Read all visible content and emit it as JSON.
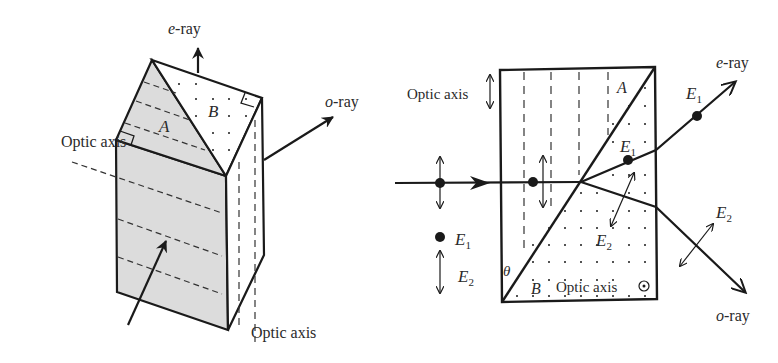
{
  "figure": {
    "left_panel": {
      "name": "Wollaston-style prism (3D view)",
      "labels": {
        "e_ray": "e-ray",
        "e_ray_italic": "e",
        "e_ray_rest": "-ray",
        "o_ray_italic": "o",
        "o_ray_rest": "-ray",
        "optic_axis_left": "Optic axis",
        "optic_axis_bottom": "Optic axis",
        "prism_a": "A",
        "prism_b": "B"
      }
    },
    "right_panel": {
      "name": "Prism cross-section with ray paths",
      "labels": {
        "optic_axis_top": "Optic axis",
        "optic_axis_bottom": "Optic axis",
        "prism_a": "A",
        "prism_b": "B",
        "theta": "θ",
        "e_ray_italic": "e",
        "e_ray_rest": "-ray",
        "o_ray_italic": "o",
        "o_ray_rest": "-ray",
        "E": "E",
        "sub1": "1",
        "sub2": "2"
      },
      "legend": [
        {
          "symbol": "dot",
          "label": "E",
          "sub": "1"
        },
        {
          "symbol": "double-arrow",
          "label": "E",
          "sub": "2"
        }
      ]
    },
    "colors": {
      "ink": "#1a1a1a",
      "shade": "#dcdcdc",
      "text": "#2a2a2a"
    }
  }
}
